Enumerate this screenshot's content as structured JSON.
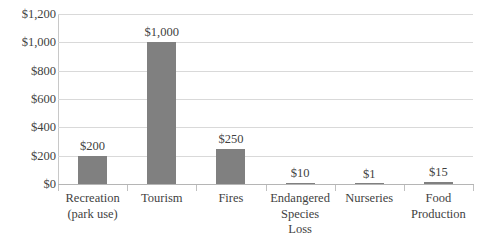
{
  "chart_data": {
    "type": "bar",
    "title": "",
    "subtitle": "",
    "xlabel": "",
    "ylabel": "",
    "categories": [
      "Recreation (park use)",
      "Tourism",
      "Fires",
      "Endangered Species Loss",
      "Nurseries",
      "Food Production"
    ],
    "category_lines": [
      [
        "Recreation",
        "(park use)"
      ],
      [
        "Tourism"
      ],
      [
        "Fires"
      ],
      [
        "Endangered",
        "Species",
        "Loss"
      ],
      [
        "Nurseries"
      ],
      [
        "Food",
        "Production"
      ]
    ],
    "values": [
      200,
      1000,
      250,
      10,
      1,
      15
    ],
    "data_labels": [
      "$200",
      "$1,000",
      "$250",
      "$10",
      "$1",
      "$15"
    ],
    "ylim": [
      0,
      1200
    ],
    "ytick_values": [
      1200,
      1000,
      800,
      600,
      400,
      200,
      0
    ],
    "ytick_labels": [
      "$1,200",
      "$1,000",
      "$800",
      "$600",
      "$400",
      "$200",
      "$0"
    ],
    "grid": true,
    "grid_axis": "y",
    "legend": false,
    "legend_position": "none",
    "bar_color": "#808080",
    "gridline_color": "#d9d9d9",
    "axis_color": "#b5b5b5",
    "text_color": "#3f3f3f",
    "background_color": "#ffffff"
  }
}
